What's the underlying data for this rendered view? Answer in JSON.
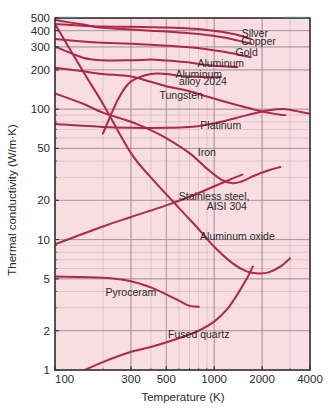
{
  "chart_data": {
    "type": "line",
    "title": "",
    "xlabel": "Temperature (K)",
    "ylabel": "Thermal conductivity (W/m·K)",
    "xscale": "log",
    "yscale": "log",
    "xlim": [
      100,
      4000
    ],
    "ylim": [
      1,
      500
    ],
    "grid": true,
    "legend": "inline-curve-labels",
    "xticks": [
      100,
      300,
      500,
      1000,
      2000,
      4000
    ],
    "xtick_labels": [
      "100",
      "300",
      "500",
      "1000",
      "2000",
      "4000"
    ],
    "yticks": [
      1,
      2,
      5,
      10,
      20,
      50,
      100,
      200,
      300,
      400,
      500
    ],
    "ytick_labels": [
      "1",
      "2",
      "5",
      "10",
      "20",
      "50",
      "100",
      "200",
      "300",
      "400",
      "500"
    ],
    "colors": {
      "plot_background": "#f8dde2",
      "curve": "#b02747",
      "grid": "#9a8d94",
      "axis": "#3a3438",
      "text": "#2b2b2b",
      "page_background": "#ffffff"
    },
    "series": [
      {
        "name": "Silver",
        "label": "Silver",
        "x": [
          100,
          150,
          200,
          300,
          400,
          500,
          700,
          900,
          1100,
          1300,
          1500,
          1700
        ],
        "y": [
          450,
          437,
          430,
          428,
          425,
          422,
          415,
          405,
          392,
          378,
          362,
          345
        ]
      },
      {
        "name": "Copper",
        "label": "Copper",
        "x": [
          100,
          150,
          200,
          300,
          400,
          500,
          700,
          900,
          1100,
          1300,
          1500,
          1700
        ],
        "y": [
          482,
          445,
          420,
          408,
          400,
          394,
          382,
          370,
          357,
          344,
          330,
          318
        ]
      },
      {
        "name": "Gold",
        "label": "Gold",
        "x": [
          100,
          150,
          200,
          300,
          400,
          500,
          700,
          900,
          1100,
          1300,
          1500,
          1700
        ],
        "y": [
          345,
          330,
          323,
          317,
          312,
          307,
          298,
          288,
          278,
          268,
          258,
          250
        ]
      },
      {
        "name": "Aluminum",
        "label": "Aluminum",
        "x": [
          100,
          150,
          200,
          300,
          400,
          500,
          700,
          800,
          900,
          1000,
          1200,
          1400
        ],
        "y": [
          302,
          248,
          237,
          237,
          240,
          236,
          228,
          222,
          218,
          215,
          212,
          210
        ]
      },
      {
        "name": "Aluminum alloy 2024",
        "label": "Aluminum\nalloy 2024",
        "x": [
          200,
          250,
          300,
          400,
          500,
          600,
          700,
          800,
          900,
          1000,
          1100
        ],
        "y": [
          65,
          120,
          163,
          186,
          186,
          180,
          178,
          177,
          176,
          176,
          177
        ]
      },
      {
        "name": "Tungsten",
        "label": "Tungsten",
        "x": [
          100,
          150,
          200,
          300,
          400,
          500,
          700,
          900,
          1200,
          1600,
          2000,
          2400,
          2800
        ],
        "y": [
          208,
          195,
          186,
          178,
          162,
          150,
          137,
          125,
          113,
          103,
          96,
          92,
          90
        ]
      },
      {
        "name": "Platinum",
        "label": "Platinum",
        "x": [
          100,
          200,
          300,
          500,
          700,
          900,
          1200,
          1500,
          1800,
          2200,
          2800,
          3500,
          4000
        ],
        "y": [
          77,
          73,
          72,
          72,
          73,
          76,
          82,
          88,
          93,
          98,
          100,
          95,
          92
        ]
      },
      {
        "name": "Iron",
        "label": "Iron",
        "x": [
          100,
          150,
          200,
          300,
          400,
          500,
          700,
          900,
          1100,
          1300,
          1500,
          1800,
          2200,
          2600
        ],
        "y": [
          132,
          110,
          94,
          80,
          69,
          60,
          46,
          35,
          29,
          27,
          28,
          31,
          34,
          36
        ]
      },
      {
        "name": "Stainless steel, AISI 304",
        "label": "Stainless steel,\nAISI 304",
        "x": [
          100,
          200,
          300,
          500,
          700,
          900,
          1100,
          1300,
          1500
        ],
        "y": [
          9.2,
          12.6,
          14.9,
          18.3,
          21.3,
          24.2,
          26.9,
          29.3,
          31.5
        ]
      },
      {
        "name": "Aluminum oxide",
        "label": "Aluminum oxide",
        "x": [
          100,
          150,
          200,
          300,
          400,
          600,
          800,
          1000,
          1300,
          1600,
          1900,
          2200,
          2600,
          3000
        ],
        "y": [
          450,
          195,
          110,
          46,
          30,
          17.5,
          12,
          8.8,
          6.6,
          5.7,
          5.5,
          5.6,
          6.2,
          7.2
        ]
      },
      {
        "name": "Pyroceram",
        "label": "Pyroceram",
        "x": [
          100,
          200,
          300,
          400,
          500,
          600,
          700,
          800
        ],
        "y": [
          5.2,
          5.1,
          4.8,
          4.3,
          3.8,
          3.4,
          3.1,
          3.05
        ]
      },
      {
        "name": "Fused quartz",
        "label": "Fused quartz",
        "x": [
          140,
          200,
          300,
          400,
          600,
          800,
          1000,
          1200,
          1400,
          1600,
          1750
        ],
        "y": [
          0.95,
          1.15,
          1.38,
          1.5,
          1.75,
          2.0,
          2.35,
          2.9,
          3.8,
          5.0,
          6.2
        ]
      }
    ],
    "annotations": [
      {
        "text": "Silver",
        "x": 1800,
        "y": 360
      },
      {
        "text": "Copper",
        "x": 1900,
        "y": 310
      },
      {
        "text": "Gold",
        "x": 1600,
        "y": 255
      },
      {
        "text": "Aluminum",
        "x": 1100,
        "y": 212
      },
      {
        "text": "Aluminum",
        "x": 800,
        "y": 172
      },
      {
        "text": "alloy 2024",
        "x": 850,
        "y": 152
      },
      {
        "text": "Tungsten",
        "x": 620,
        "y": 120
      },
      {
        "text": "Platinum",
        "x": 1100,
        "y": 70
      },
      {
        "text": "Iron",
        "x": 900,
        "y": 44
      },
      {
        "text": "Stainless steel,",
        "x": 1000,
        "y": 20
      },
      {
        "text": "AISI 304",
        "x": 1200,
        "y": 17
      },
      {
        "text": "Aluminum oxide",
        "x": 1400,
        "y": 10
      },
      {
        "text": "Pyroceram",
        "x": 300,
        "y": 3.7
      },
      {
        "text": "Fused quartz",
        "x": 800,
        "y": 1.75
      }
    ]
  }
}
